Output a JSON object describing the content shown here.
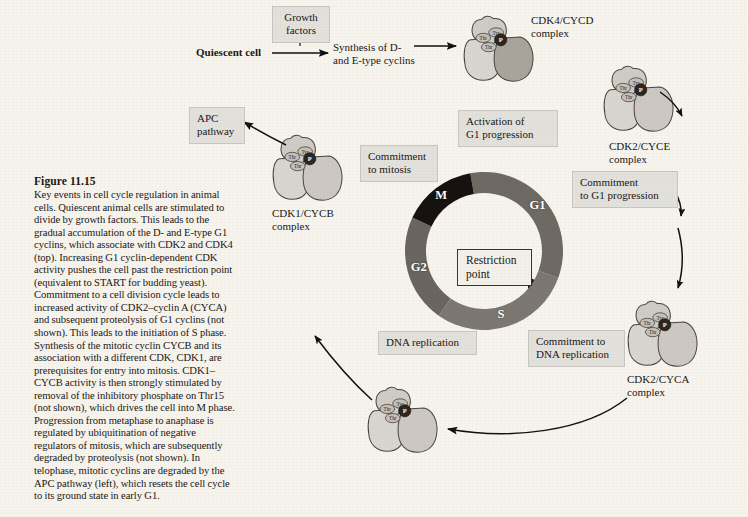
{
  "figure": {
    "number": "Figure 11.15",
    "caption": "Key events in cell cycle regulation in animal cells. Quiescent animal cells are stimulated to divide by growth factors. This leads to the gradual accumulation of the D- and E-type G1 cyclins, which associate with CDK2 and CDK4 (top). Increasing G1 cyclin-dependent CDK activity pushes the cell past the restriction point (equivalent to START for budding yeast). Commitment to a cell division cycle leads to increased activity of CDK2–cyclin A (CYCA) and subsequent proteolysis of G1 cyclins (not shown). This leads to the initiation of S phase. Synthesis of the mitotic cyclin CYCB and its association with a different CDK, CDK1, are prerequisites for entry into mitosis. CDK1–CYCB activity is then strongly stimulated by removal of the inhibitory phosphate on Thr15 (not shown), which drives the cell into M phase. Progression from metaphase to anaphase is regulated by ubiquitination of negative regulators of mitosis, which are subsequently degraded by proteolysis (not shown). In telophase, mitotic cyclins are degraded by the APC pathway (left), which resets the cell cycle to its ground state in early G1."
  },
  "flow": {
    "quiescent_cell": "Quiescent cell",
    "growth_factors": "Growth\nfactors",
    "synthesis": "Synthesis of D-\nand E-type cyclins"
  },
  "boxes": {
    "apc_pathway": "APC\npathway",
    "commitment_mitosis": "Commitment\nto mitosis",
    "activation_g1": "Activation of\nG1 progression",
    "commitment_g1": "Commitment\nto G1 progression",
    "commitment_dna": "Commitment to\nDNA replication",
    "dna_replication": "DNA replication",
    "restriction_point": "Restriction\npoint"
  },
  "complexes": {
    "cdk4_cycd": "CDK4/CYCD\ncomplex",
    "cdk2_cyce": "CDK2/CYCE\ncomplex",
    "cdk2_cyca": "CDK2/CYCA\ncomplex",
    "cdk1_cycb": "CDK1/CYCB\ncomplex",
    "residues": {
      "tyr": "Tyr",
      "thr": "Thr",
      "phosphate": "P"
    }
  },
  "chart_data": {
    "type": "pie",
    "center_label": "Restriction\npoint",
    "legend_position": "on-ring",
    "categories": [
      "M",
      "G1",
      "S",
      "G2"
    ],
    "values": [
      15,
      30,
      30,
      25
    ],
    "units": "percent of cycle (ring arc)",
    "segments": [
      {
        "label": "M",
        "start_deg": 295,
        "end_deg": 350,
        "color": "#17120f",
        "text_color": "#ffffff"
      },
      {
        "label": "G1",
        "start_deg": 350,
        "end_deg": 110,
        "color": "#6e6963",
        "text_color": "#ffffff"
      },
      {
        "label": "S",
        "start_deg": 110,
        "end_deg": 215,
        "color": "#7c7770",
        "text_color": "#ffffff"
      },
      {
        "label": "G2",
        "start_deg": 215,
        "end_deg": 295,
        "color": "#6a655f",
        "text_color": "#ffffff"
      }
    ],
    "grid": false,
    "inner_radius": 58,
    "outer_radius": 80
  },
  "colors": {
    "page_background": "#f7f4ee",
    "box_fill": "#e3e1dc",
    "box_border": "#c9c6c0",
    "ink": "#1a1714",
    "m_phase": "#17120f",
    "g1_phase": "#6e6963",
    "s_phase": "#7c7770",
    "g2_phase": "#6a655f",
    "cdk_lobe_light": "#d7d4ce",
    "cdk_lobe_dark": "#9d9890",
    "arrow": "#111111"
  }
}
